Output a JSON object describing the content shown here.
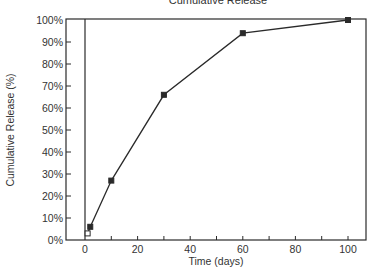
{
  "chart_data": {
    "type": "line",
    "title": "Cumulative Release",
    "xlabel": "Time (days)",
    "ylabel": "Cumulative Release (%)",
    "xlim": [
      -7,
      107
    ],
    "ylim": [
      0,
      100
    ],
    "x_ticks": [
      0,
      20,
      40,
      60,
      80,
      100
    ],
    "x_minor_ticks": [
      10,
      30,
      50,
      70,
      90
    ],
    "y_ticks": [
      0,
      10,
      20,
      30,
      40,
      50,
      60,
      70,
      80,
      90,
      100
    ],
    "y_tick_labels": [
      "0%",
      "10%",
      "20%",
      "30%",
      "40%",
      "50%",
      "60%",
      "70%",
      "80%",
      "90%",
      "100%"
    ],
    "grid": false,
    "legend": null,
    "zero_line": true,
    "series": [
      {
        "name": "Cumulative Release",
        "x": [
          1,
          2,
          10,
          30,
          60,
          100
        ],
        "y": [
          3,
          6,
          27,
          66,
          94,
          100
        ],
        "markers": [
          "open-square",
          "filled-square",
          "filled-square",
          "filled-square",
          "filled-square",
          "filled-square"
        ]
      }
    ]
  },
  "colors": {
    "line": "#2a2a2a",
    "axis": "#2a2a2a",
    "background": "#ffffff"
  }
}
